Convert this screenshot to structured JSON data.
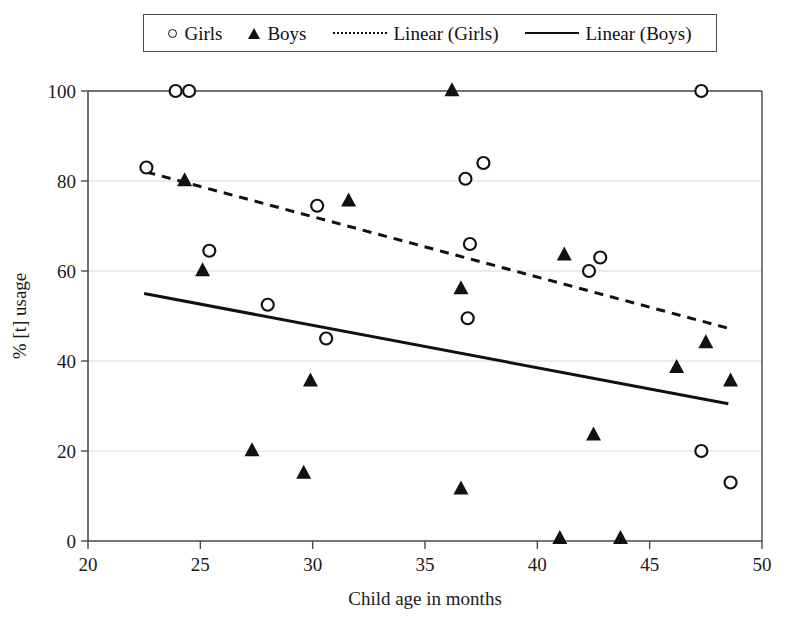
{
  "legend": {
    "entries": [
      {
        "marker": "circle-marker-icon",
        "label": "Girls"
      },
      {
        "marker": "triangle-marker-icon",
        "label": "Boys"
      },
      {
        "marker": "dashed-line-icon",
        "label": "Linear (Girls)"
      },
      {
        "marker": "solid-line-icon",
        "label": "Linear (Boys)"
      }
    ]
  },
  "chart_data": {
    "type": "scatter",
    "title": "",
    "xlabel": "Child age in months",
    "ylabel": "% [t] usage",
    "xlim": [
      20,
      50
    ],
    "ylim": [
      0,
      100
    ],
    "xticks": [
      20,
      25,
      30,
      35,
      40,
      45,
      50
    ],
    "yticks": [
      0,
      20,
      40,
      60,
      80,
      100
    ],
    "grid": "horizontal",
    "legend_position": "top",
    "marker_color": "#111111",
    "axis_color": "#4a4a4a",
    "grid_color": "#d8d8d8",
    "series": [
      {
        "name": "Girls",
        "marker": "open-circle",
        "points": [
          [
            22.6,
            83.0
          ],
          [
            23.9,
            100.0
          ],
          [
            24.5,
            100.0
          ],
          [
            25.4,
            64.5
          ],
          [
            28.0,
            52.5
          ],
          [
            30.2,
            74.5
          ],
          [
            30.6,
            45.0
          ],
          [
            36.8,
            80.5
          ],
          [
            37.6,
            84.0
          ],
          [
            37.0,
            66.0
          ],
          [
            36.9,
            49.5
          ],
          [
            42.3,
            60.0
          ],
          [
            42.8,
            63.0
          ],
          [
            47.3,
            100.0
          ],
          [
            47.3,
            20.0
          ],
          [
            48.6,
            13.0
          ]
        ]
      },
      {
        "name": "Boys",
        "marker": "filled-triangle",
        "points": [
          [
            24.3,
            80.0
          ],
          [
            25.1,
            60.0
          ],
          [
            27.3,
            20.0
          ],
          [
            29.6,
            15.0
          ],
          [
            29.9,
            35.5
          ],
          [
            31.6,
            75.5
          ],
          [
            36.2,
            100.0
          ],
          [
            36.6,
            56.0
          ],
          [
            36.6,
            11.5
          ],
          [
            41.2,
            63.5
          ],
          [
            41.0,
            0.5
          ],
          [
            42.5,
            23.5
          ],
          [
            43.7,
            0.5
          ],
          [
            46.2,
            38.5
          ],
          [
            47.5,
            44.0
          ],
          [
            48.6,
            35.5
          ]
        ]
      }
    ],
    "trendlines": [
      {
        "name": "Linear (Girls)",
        "style": "dashed",
        "x_start": 22.6,
        "y_start": 82.0,
        "x_end": 48.7,
        "y_end": 47.0
      },
      {
        "name": "Linear (Boys)",
        "style": "solid",
        "x_start": 22.5,
        "y_start": 55.0,
        "x_end": 48.5,
        "y_end": 30.5
      }
    ]
  }
}
